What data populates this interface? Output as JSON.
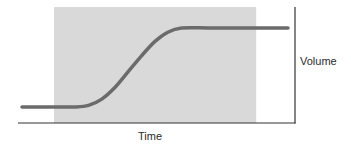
{
  "chart_data": {
    "type": "line",
    "title": "",
    "xlabel": "Time",
    "ylabel": "Volume",
    "ylabel_position": "right",
    "grid": false,
    "ticks": false,
    "legend": null,
    "shaded_region": {
      "description": "gray shaded band spanning most of the plot, starting after the initial flat segment's start and ending before the right axis",
      "x_start_fraction": 0.13,
      "x_end_fraction": 0.86,
      "color": "#d9d9d9"
    },
    "series": [
      {
        "name": "Volume",
        "shape": "sigmoid",
        "color": "#6b6b6b",
        "x": [
          0.0,
          0.1,
          0.2,
          0.25,
          0.3,
          0.35,
          0.4,
          0.45,
          0.5,
          0.55,
          0.6,
          0.7,
          0.8,
          0.9,
          1.0
        ],
        "values": [
          0.0,
          0.0,
          0.0,
          0.02,
          0.1,
          0.25,
          0.45,
          0.65,
          0.83,
          0.95,
          1.0,
          1.0,
          1.0,
          1.0,
          1.0
        ]
      }
    ],
    "xlim": [
      0,
      1
    ],
    "ylim": [
      0,
      1
    ]
  },
  "colors": {
    "shade": "#d9d9d9",
    "curve": "#6b6b6b",
    "axis": "#333333",
    "text": "#2a2a2a"
  }
}
